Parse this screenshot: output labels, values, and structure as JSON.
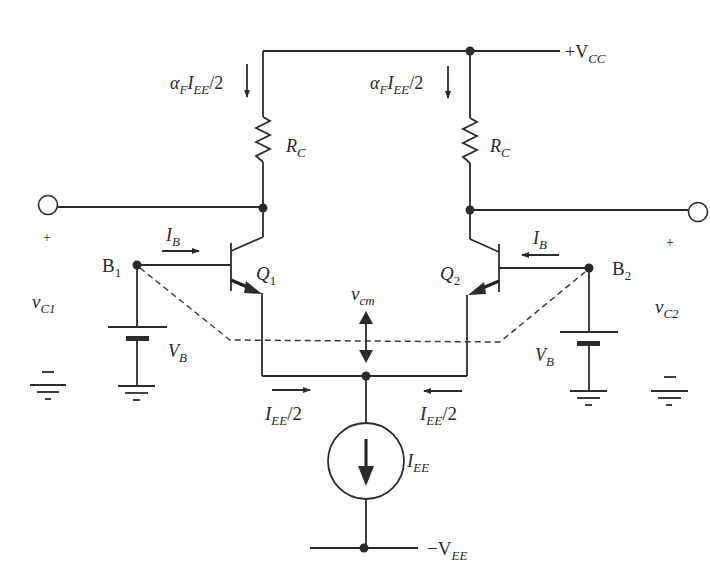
{
  "diagram": {
    "type": "circuit-schematic",
    "colors": {
      "ink": "#2b2b2b",
      "background": "#ffffff"
    },
    "labels": {
      "vcc": "+V",
      "vcc_sub": "CC",
      "vee": "−V",
      "vee_sub": "EE",
      "collector_current_left": {
        "alpha": "α",
        "alpha_sub": "F",
        "i": "I",
        "i_sub": "EE",
        "tail": "/2"
      },
      "collector_current_right": {
        "alpha": "α",
        "alpha_sub": "F",
        "i": "I",
        "i_sub": "EE",
        "tail": "/2"
      },
      "rc_left": "R",
      "rc_left_sub": "C",
      "rc_right": "R",
      "rc_right_sub": "C",
      "q1": "Q",
      "q1_sub": "1",
      "q2": "Q",
      "q2_sub": "2",
      "b1": "B",
      "b1_sub": "1",
      "b2": "B",
      "b2_sub": "2",
      "ib_left": "I",
      "ib_left_sub": "B",
      "ib_right": "I",
      "ib_right_sub": "B",
      "vb_left": "V",
      "vb_left_sub": "B",
      "vb_right": "V",
      "vb_right_sub": "B",
      "vc1": "v",
      "vc1_sub": "C1",
      "vc2": "v",
      "vc2_sub": "C2",
      "vcm": "v",
      "vcm_sub": "cm",
      "iee_half_left": "I",
      "iee_half_left_sub": "EE",
      "iee_half_left_tail": "/2",
      "iee_half_right": "I",
      "iee_half_right_sub": "EE",
      "iee_half_right_tail": "/2",
      "iee": "I",
      "iee_sub": "EE",
      "plus_left": "+",
      "plus_right": "+",
      "minus_left": "−",
      "minus_right": "−"
    },
    "components": [
      {
        "id": "Q1",
        "kind": "npn-bjt"
      },
      {
        "id": "Q2",
        "kind": "npn-bjt"
      },
      {
        "id": "RC-left",
        "kind": "resistor"
      },
      {
        "id": "RC-right",
        "kind": "resistor"
      },
      {
        "id": "VB-left",
        "kind": "battery"
      },
      {
        "id": "VB-right",
        "kind": "battery"
      },
      {
        "id": "IEE",
        "kind": "current-source"
      }
    ]
  }
}
